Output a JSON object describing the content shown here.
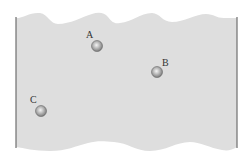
{
  "diagram": {
    "type": "fluid-container-cross-section",
    "colors": {
      "background": "#ffffff",
      "fluid_fill": "#dedede",
      "wall_stroke": "#6e6e6e",
      "ball_light": "#f2f2f2",
      "ball_mid": "#a8a8a8",
      "ball_dark": "#6a6a6a",
      "label": "#333333"
    },
    "walls": {
      "left": {
        "x": 16,
        "y1": 17,
        "y2": 148
      },
      "right": {
        "x": 237,
        "y1": 17,
        "y2": 148
      }
    },
    "points": [
      {
        "label": "A",
        "cx": 97,
        "cy": 46,
        "r": 5.5,
        "label_x": 86,
        "label_y": 38
      },
      {
        "label": "B",
        "cx": 157,
        "cy": 72,
        "r": 5.5,
        "label_x": 162,
        "label_y": 66
      },
      {
        "label": "C",
        "cx": 41,
        "cy": 111,
        "r": 5.5,
        "label_x": 30,
        "label_y": 103
      }
    ]
  }
}
